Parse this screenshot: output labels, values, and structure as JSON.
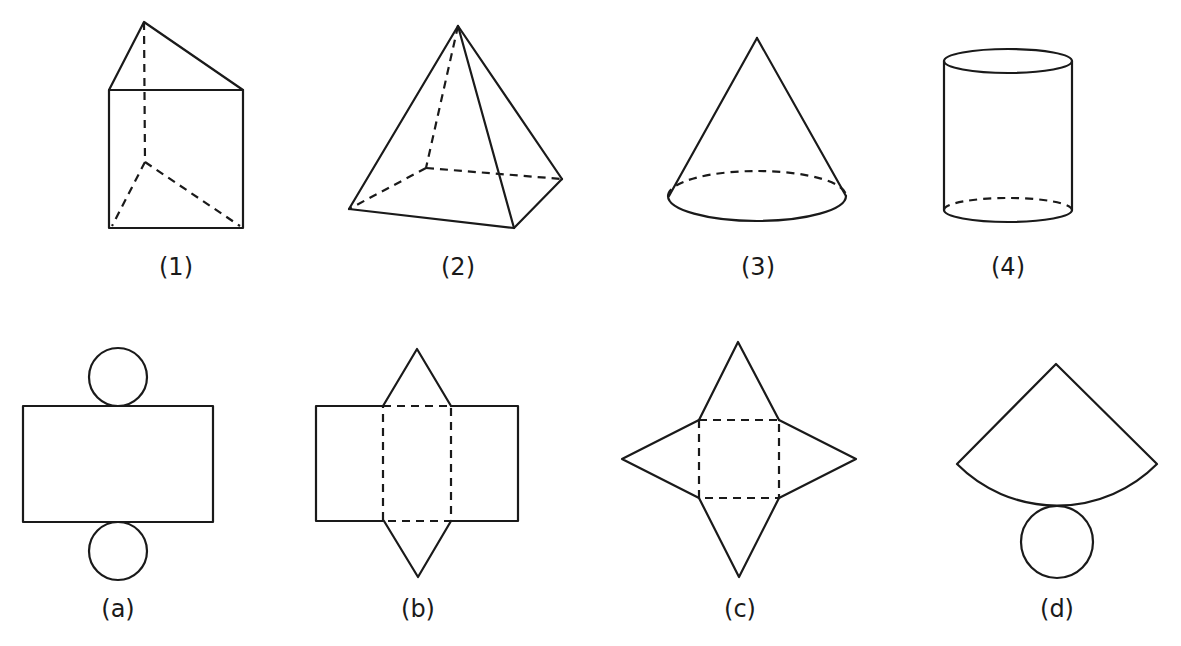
{
  "figure": {
    "solids": [
      {
        "id": "1",
        "label": "(1)",
        "shape": "triangular prism"
      },
      {
        "id": "2",
        "label": "(2)",
        "shape": "square pyramid"
      },
      {
        "id": "3",
        "label": "(3)",
        "shape": "cone"
      },
      {
        "id": "4",
        "label": "(4)",
        "shape": "cylinder"
      }
    ],
    "nets": [
      {
        "id": "a",
        "label": "(a)",
        "shape": "cylinder net (rectangle with two circles)"
      },
      {
        "id": "b",
        "label": "(b)",
        "shape": "triangular prism net (rectangles with two triangles)"
      },
      {
        "id": "c",
        "label": "(c)",
        "shape": "square pyramid net (square with four triangles)"
      },
      {
        "id": "d",
        "label": "(d)",
        "shape": "cone net (sector with circle)"
      }
    ]
  },
  "colors": {
    "stroke": "#1a1a1a",
    "background": "#ffffff"
  }
}
